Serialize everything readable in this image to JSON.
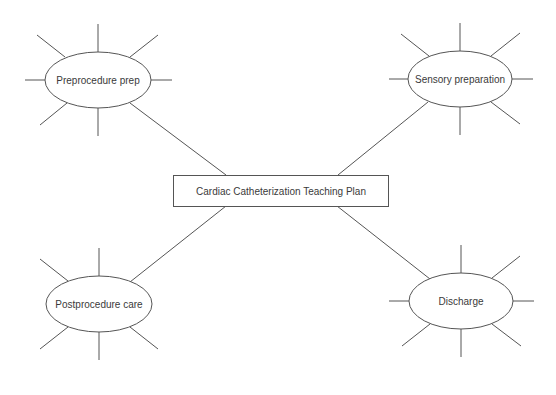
{
  "diagram": {
    "center": {
      "label": "Cardiac Catheterization Teaching Plan"
    },
    "nodes": [
      {
        "id": "preprocedure",
        "label": "Preprocedure prep"
      },
      {
        "id": "sensory",
        "label": "Sensory preparation"
      },
      {
        "id": "postprocedure",
        "label": "Postprocedure care"
      },
      {
        "id": "discharge",
        "label": "Discharge"
      }
    ]
  }
}
